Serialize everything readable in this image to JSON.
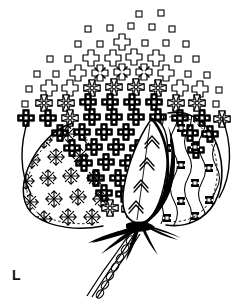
{
  "figure": {
    "plate_label": "L",
    "caption": "",
    "medium": "pen-and-ink line drawing",
    "background_color": "#ffffff",
    "ink_color": "#000000",
    "canvas": {
      "width": 251,
      "height": 299
    }
  },
  "regions": {
    "fiber_mass": {
      "name": "cotton-fiber-mass",
      "description": "dome of stylized cross motifs fading from dense black at the core to sparse open squares at the top",
      "motif_sequence": [
        "open-square",
        "outline-cross",
        "hatched-cross",
        "filled-cross"
      ],
      "rows": 13
    },
    "left_bract": {
      "name": "left-bract",
      "description": "left lobe filled with a lattice of asterisk star motifs",
      "motif": "asterisk-star",
      "columns": 5,
      "rows": 6
    },
    "right_bract": {
      "name": "right-bract",
      "description": "right lobe of wavy vertical lines with small dark rosette squares between them",
      "motif": "wavy-line-rosette",
      "wave_columns": 6
    },
    "center_leaf": {
      "name": "center-leaf",
      "description": "central pointed leaf bearing stacked chevron markings",
      "motif": "chevron",
      "chevron_count": 4
    },
    "stem": {
      "name": "stem",
      "description": "braided chain-stitch stem descending to the lower left with splayed sepal spikes at the calyx",
      "strands": 3,
      "spike_count": 7
    }
  },
  "palette": {
    "ink": "#000000",
    "paper": "#ffffff",
    "mid_gray": "#555555"
  }
}
